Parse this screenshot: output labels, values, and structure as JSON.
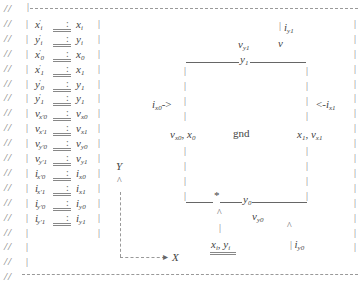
{
  "comment_prefix": "//",
  "left_border_glyph": "|",
  "mapping_table": {
    "separator": ":",
    "rows": [
      {
        "lhs": "x",
        "lhs_sub": "i",
        "lhs_prime": "′",
        "rhs": "x",
        "rhs_sub": "i"
      },
      {
        "lhs": "y",
        "lhs_sub": "i",
        "lhs_prime": "′",
        "rhs": "y",
        "rhs_sub": "i"
      },
      {
        "lhs": "x",
        "lhs_sub": "0",
        "lhs_prime": "′",
        "rhs": "x",
        "rhs_sub": "0"
      },
      {
        "lhs": "x",
        "lhs_sub": "1",
        "lhs_prime": "′",
        "rhs": "x",
        "rhs_sub": "1"
      },
      {
        "lhs": "y",
        "lhs_sub": "0",
        "lhs_prime": "′",
        "rhs": "y",
        "rhs_sub": "1"
      },
      {
        "lhs": "y",
        "lhs_sub": "1",
        "lhs_prime": "′",
        "rhs": "y",
        "rhs_sub": "1"
      },
      {
        "lhs": "v",
        "lhs_sub": "x′0",
        "lhs_prime": "",
        "rhs": "v",
        "rhs_sub": "x0"
      },
      {
        "lhs": "v",
        "lhs_sub": "x′1",
        "lhs_prime": "",
        "rhs": "v",
        "rhs_sub": "x1"
      },
      {
        "lhs": "v",
        "lhs_sub": "y′0",
        "lhs_prime": "",
        "rhs": "v",
        "rhs_sub": "y0"
      },
      {
        "lhs": "v",
        "lhs_sub": "y′1",
        "lhs_prime": "",
        "rhs": "v",
        "rhs_sub": "y1"
      },
      {
        "lhs": "i",
        "lhs_sub": "x′0",
        "lhs_prime": "",
        "rhs": "i",
        "rhs_sub": "x0"
      },
      {
        "lhs": "i",
        "lhs_sub": "x′1",
        "lhs_prime": "",
        "rhs": "i",
        "rhs_sub": "x1"
      },
      {
        "lhs": "i",
        "lhs_sub": "y′0",
        "lhs_prime": "",
        "rhs": "i",
        "rhs_sub": "y0"
      },
      {
        "lhs": "i",
        "lhs_sub": "y′1",
        "lhs_prime": "",
        "rhs": "i",
        "rhs_sub": "y1"
      }
    ]
  },
  "axes": {
    "y_label": "Y",
    "x_label": "X",
    "y_arrow": "^",
    "x_arrow": "->"
  },
  "grid_cell": {
    "center_label": "gnd",
    "top": {
      "edge_label": "y",
      "edge_sub": "1",
      "voltage": "v",
      "voltage_sub": "y1",
      "current": "i",
      "current_sub": "y1",
      "v_label": "v"
    },
    "bottom": {
      "edge_label": "y",
      "edge_sub": "0",
      "voltage": "v",
      "voltage_sub": "y0",
      "current": "i",
      "current_sub": "y0",
      "caret": "^",
      "star": "*"
    },
    "left": {
      "coord": "x",
      "coord_sub": "0",
      "voltage": "v",
      "voltage_sub": "x0",
      "current": "i",
      "current_sub": "x0",
      "arrow": "->"
    },
    "right": {
      "coord": "x",
      "coord_sub": "1",
      "voltage": "v",
      "voltage_sub": "x1",
      "current": "i",
      "current_sub": "x1",
      "arrow": "<-"
    },
    "point": {
      "x": "x",
      "x_sub": "i",
      "y": "y",
      "y_sub": "i",
      "sep": ","
    }
  }
}
